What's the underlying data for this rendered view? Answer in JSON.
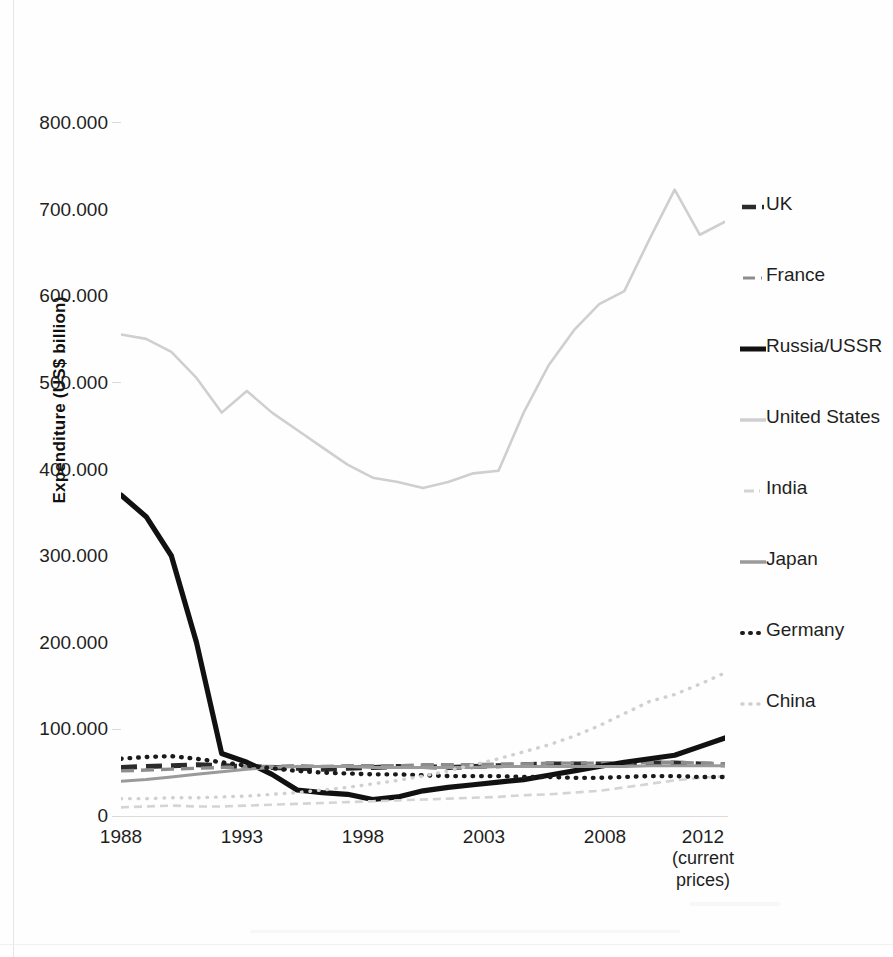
{
  "chart_data": {
    "type": "line",
    "title": "",
    "xlabel": "",
    "ylabel": "Expenditure (US$ billion)",
    "xlabel_note": "(current prices)",
    "ylim": [
      0,
      800000
    ],
    "xlim": [
      1988,
      2012
    ],
    "grid": false,
    "legend_position": "right",
    "y_tick_labels": [
      "800.000",
      "700.000",
      "600.000",
      "500.000",
      "400.000",
      "300.000",
      "200.000",
      "100.000",
      "0"
    ],
    "y_tick_values": [
      800000,
      700000,
      600000,
      500000,
      400000,
      300000,
      200000,
      100000,
      0
    ],
    "x_tick_labels": [
      "1988",
      "1993",
      "1998",
      "2003",
      "2008",
      "2012"
    ],
    "x_tick_values": [
      1988,
      1993,
      1998,
      2003,
      2008,
      2012
    ],
    "x": [
      1988,
      1989,
      1990,
      1991,
      1992,
      1993,
      1994,
      1995,
      1996,
      1997,
      1998,
      1999,
      2000,
      2001,
      2002,
      2003,
      2004,
      2005,
      2006,
      2007,
      2008,
      2009,
      2010,
      2011,
      2012
    ],
    "series": [
      {
        "name": "UK",
        "style": "dashed-thick-dark",
        "color": "#2b2b2b",
        "values": [
          56,
          57,
          58,
          59,
          58,
          57,
          56,
          55,
          54,
          55,
          56,
          57,
          57,
          56,
          57,
          58,
          59,
          60,
          60,
          60,
          60,
          61,
          61,
          60,
          59
        ]
      },
      {
        "name": "France",
        "style": "dashed-gray",
        "color": "#8d8d8d",
        "values": [
          52,
          53,
          54,
          55,
          56,
          57,
          57,
          58,
          57,
          58,
          58,
          58,
          59,
          59,
          59,
          60,
          60,
          61,
          61,
          61,
          61,
          62,
          62,
          61,
          60
        ]
      },
      {
        "name": "Russia/USSR",
        "style": "solid-thick-black",
        "color": "#111111",
        "values": [
          370,
          345,
          300,
          200,
          72,
          62,
          48,
          30,
          27,
          25,
          19,
          22,
          29,
          33,
          36,
          39,
          42,
          47,
          52,
          57,
          62,
          66,
          70,
          80,
          90
        ]
      },
      {
        "name": "United States",
        "style": "solid-lightgray",
        "color": "#cfcfcf",
        "values": [
          555,
          550,
          535,
          505,
          465,
          490,
          465,
          445,
          425,
          405,
          390,
          385,
          378,
          385,
          395,
          398,
          465,
          520,
          560,
          590,
          605,
          665,
          722,
          670,
          685
        ]
      },
      {
        "name": "India",
        "style": "dashed-lightgray-short",
        "color": "#d4d4d4",
        "values": [
          10,
          11,
          12,
          11,
          11,
          12,
          13,
          14,
          15,
          16,
          17,
          18,
          19,
          20,
          21,
          22,
          24,
          25,
          27,
          29,
          33,
          37,
          41,
          44,
          46
        ]
      },
      {
        "name": "Japan",
        "style": "solid-gray",
        "color": "#9a9a9a",
        "values": [
          40,
          42,
          45,
          48,
          51,
          54,
          56,
          57,
          57,
          57,
          56,
          56,
          56,
          56,
          56,
          57,
          57,
          57,
          57,
          57,
          57,
          58,
          58,
          58,
          58
        ]
      },
      {
        "name": "Germany",
        "style": "dotted-black",
        "color": "#1a1a1a",
        "values": [
          66,
          68,
          69,
          66,
          62,
          58,
          55,
          52,
          50,
          49,
          48,
          48,
          47,
          46,
          46,
          46,
          45,
          45,
          44,
          44,
          45,
          46,
          46,
          45,
          45
        ]
      },
      {
        "name": "China",
        "style": "dotted-lightgray",
        "color": "#d0d0d0",
        "values": [
          20,
          20,
          21,
          21,
          22,
          23,
          25,
          27,
          30,
          33,
          37,
          41,
          46,
          52,
          59,
          66,
          74,
          82,
          92,
          104,
          118,
          132,
          140,
          152,
          165
        ]
      }
    ]
  },
  "legend": {
    "items": [
      {
        "label": "UK",
        "swatch": "dash-thick-dark"
      },
      {
        "label": "France",
        "swatch": "dash-gray"
      },
      {
        "label": "Russia/USSR",
        "swatch": "solid-thick-black"
      },
      {
        "label": "United States",
        "swatch": "solid-lightgray"
      },
      {
        "label": "India",
        "swatch": "dash-lightgray"
      },
      {
        "label": "Japan",
        "swatch": "solid-gray"
      },
      {
        "label": "Germany",
        "swatch": "dots-black"
      },
      {
        "label": "China",
        "swatch": "dots-lightgray"
      }
    ]
  },
  "axes": {
    "y_title": "Expenditure (US$ billion)",
    "x_note_line1": "(current",
    "x_note_line2": "prices)"
  }
}
